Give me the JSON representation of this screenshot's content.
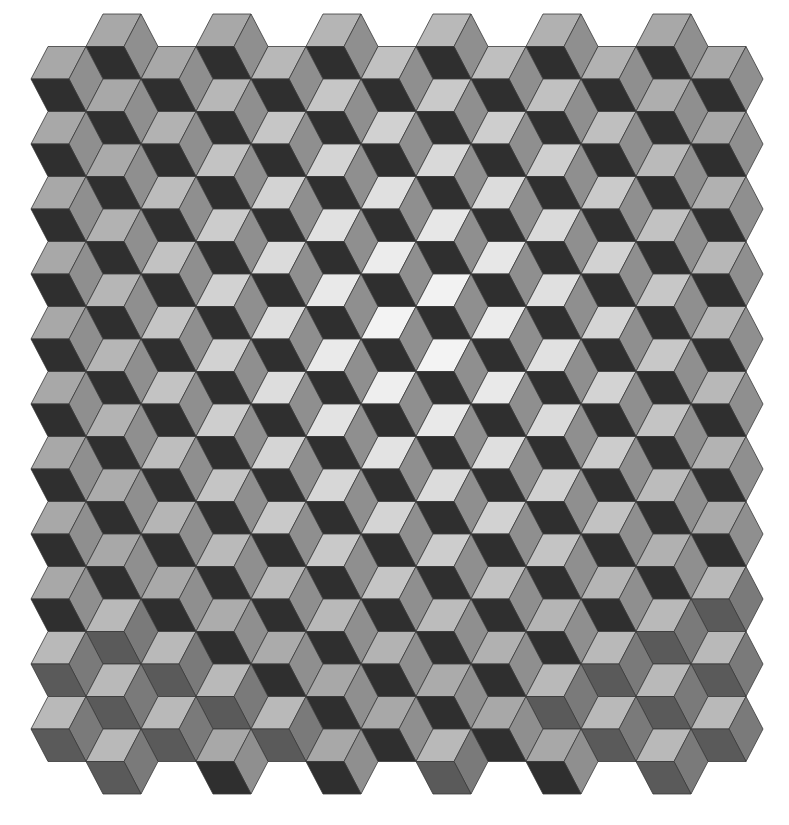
{
  "image": {
    "subject": "tumbling blocks quilt pattern",
    "description": "Grayscale tessellation of isometric cubes (hexagons split into three rhombi) forming an optical illusion; lightest faces brighten toward the center; bottom-left cubes use a muted gray palette.",
    "width": 789,
    "height": 825,
    "background": "#ffffff"
  },
  "lattice": {
    "origin_x": 103,
    "origin_y": 14,
    "edge_length": 38,
    "skew": 17,
    "half_height": 32.5,
    "column_period": 110,
    "row_shift_x": 55,
    "rows": 23,
    "even_row_cubes": 6,
    "odd_row_cubes": 7
  },
  "palette": {
    "light_face_center": "#f7f7f7",
    "light_face_edge": "#a8a8a8",
    "side_face": "#8f8f8f",
    "dark_face": "#2f2f2f",
    "muted_light": "#b9b9b9",
    "muted_side": "#7a7a7a",
    "muted_dark": "#5a5a5a",
    "stroke": "#3a3a3a"
  },
  "gradient": {
    "center_x": 430,
    "center_y": 330,
    "radius": 360
  },
  "muted_cubes": [
    [
      18,
      0
    ],
    [
      19,
      0
    ],
    [
      19,
      1
    ],
    [
      20,
      0
    ],
    [
      21,
      0
    ],
    [
      21,
      1
    ],
    [
      22,
      0
    ],
    [
      20,
      1
    ],
    [
      21,
      2
    ],
    [
      19,
      6
    ],
    [
      20,
      5
    ],
    [
      21,
      5
    ],
    [
      21,
      6
    ],
    [
      22,
      5
    ],
    [
      20,
      4
    ],
    [
      18,
      5
    ],
    [
      17,
      6
    ],
    [
      19,
      5
    ],
    [
      22,
      3
    ]
  ]
}
